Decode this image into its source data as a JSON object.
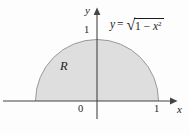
{
  "figure": {
    "colors": {
      "background": "#fdfdfd",
      "region_fill": "#dedede",
      "curve_stroke": "#9a9a9a",
      "axis": "#454545",
      "text": "#1c1c1c"
    },
    "axes": {
      "x_label": "x",
      "y_label": "y",
      "origin_label": "0",
      "x_tick_1": "1",
      "y_tick_1": "1",
      "x_range": [
        -1,
        1
      ],
      "y_range": [
        0,
        1
      ]
    },
    "region_label": "R",
    "equation": {
      "full": "y = √(1 − x²)",
      "lhs_var": "y",
      "equals": "=",
      "sqrt_symbol": "√",
      "radicand_prefix": "1 − ",
      "radicand_var": "x",
      "radicand_exponent": "2"
    }
  }
}
